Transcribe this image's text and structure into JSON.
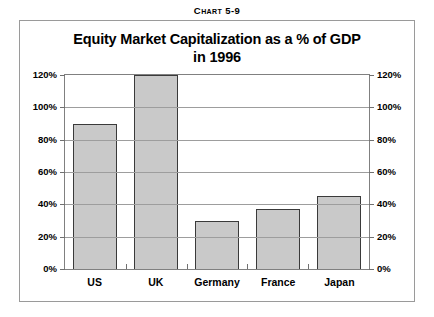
{
  "caption": {
    "lead": "C",
    "rest": "hart 5-9",
    "full": "CHART 5-9"
  },
  "title": {
    "line1": "Equity Market Capitalization as a % of GDP",
    "line2": "in 1996"
  },
  "chart_data": {
    "type": "bar",
    "title": "Equity Market Capitalization as a % of GDP in 1996",
    "xlabel": "",
    "ylabel": "",
    "categories": [
      "US",
      "UK",
      "Germany",
      "France",
      "Japan"
    ],
    "values": [
      90,
      120,
      30,
      37,
      45
    ],
    "value_labels": [
      "90%",
      "120%",
      "120%+ (clipped)",
      "37%",
      "45%"
    ],
    "ylim": [
      0,
      120
    ],
    "ytick_labels": [
      "0%",
      "20%",
      "40%",
      "60%",
      "80%",
      "100%",
      "120%"
    ],
    "ytick_values": [
      0,
      20,
      40,
      60,
      80,
      100,
      120
    ],
    "grid": true,
    "legend": "none",
    "dual_axis": true,
    "bar_fill": "#c9c9c9",
    "bar_border": "#3a3a3a",
    "note": "UK bar is clipped at the 120% axis maximum"
  },
  "axis": {
    "left_labels": [
      "120%",
      "100%",
      "80%",
      "60%",
      "40%",
      "20%",
      "0%"
    ],
    "right_labels": [
      "120%",
      "100%",
      "80%",
      "60%",
      "40%",
      "20%",
      "0%"
    ]
  }
}
